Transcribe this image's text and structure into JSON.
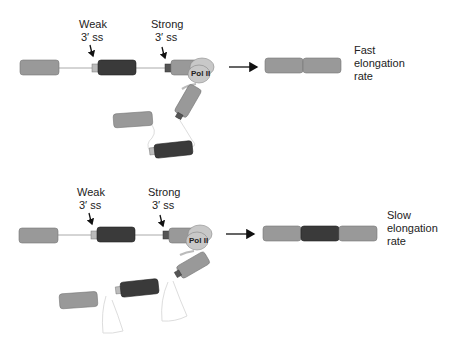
{
  "diagram": {
    "type": "alternative-splicing-kinetic-coupling",
    "colors": {
      "exon_light": "#999999",
      "exon_dark": "#3a3a3a",
      "splice_site": "#bbbbbb",
      "splice_site_strong": "#555555",
      "pol_ii": "#c8c8c8",
      "intron_line": "#aaaaaa",
      "arrow": "#111111"
    },
    "panels": [
      {
        "id": "fast",
        "weak_label_line1": "Weak",
        "weak_label_line2": "3′ ss",
        "strong_label_line1": "Strong",
        "strong_label_line2": "3′ ss",
        "polymerase_label": "Pol II",
        "outcome_label_line1": "Fast",
        "outcome_label_line2": "elongation",
        "outcome_label_line3": "rate",
        "product_exons": [
          "light",
          "light"
        ]
      },
      {
        "id": "slow",
        "weak_label_line1": "Weak",
        "weak_label_line2": "3′ ss",
        "strong_label_line1": "Strong",
        "strong_label_line2": "3′ ss",
        "polymerase_label": "Pol II",
        "outcome_label_line1": "Slow",
        "outcome_label_line2": "elongation",
        "outcome_label_line3": "rate",
        "product_exons": [
          "light",
          "dark",
          "light"
        ]
      }
    ]
  }
}
